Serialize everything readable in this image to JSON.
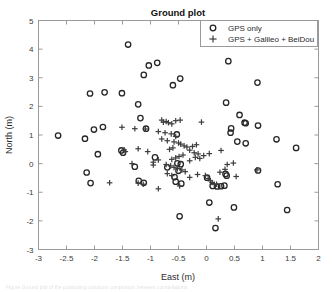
{
  "figure": {
    "title": "Ground plot",
    "caption_fragment": "Figure    Ground plot of the positioning solutions  comparison between constellations"
  },
  "legend": {
    "position": "top-right",
    "entries": [
      {
        "label": "GPS only",
        "marker": "circle-open-icon"
      },
      {
        "label": "GPS + Galileo + BeiDou",
        "marker": "plus-icon"
      }
    ]
  },
  "colors": {
    "gps_only": "#262626",
    "multi_gnss": "#3d3d3d",
    "axis": "#9a9a9a",
    "text": "#2b2b2b",
    "background": "#ffffff"
  },
  "chart_data": {
    "type": "scatter",
    "title": "Ground plot",
    "xlabel": "East (m)",
    "ylabel": "North (m)",
    "xlim": [
      -3,
      2
    ],
    "ylim": [
      -3,
      5
    ],
    "xticks": [
      -3,
      -2.5,
      -2,
      -1.5,
      -1,
      -0.5,
      0,
      0.5,
      1,
      1.5,
      2
    ],
    "xticklabels": [
      "-3",
      "-2.5",
      "-2",
      "-1.5",
      "-1",
      "-0.5",
      "0",
      "0.5",
      "1",
      "1.5",
      "2"
    ],
    "yticks": [
      -3,
      -2,
      -1,
      0,
      1,
      2,
      3,
      4,
      5
    ],
    "yticklabels": [
      "-3",
      "-2",
      "-1",
      "0",
      "1",
      "2",
      "3",
      "4",
      "5"
    ],
    "grid": false,
    "legend_position": "upper right",
    "series": [
      {
        "name": "GPS only",
        "marker": "o",
        "color": "#262626",
        "points": [
          [
            -1.4,
            4.16
          ],
          [
            -1.03,
            3.43
          ],
          [
            -0.88,
            3.52
          ],
          [
            0.39,
            3.58
          ],
          [
            -1.12,
            3.1
          ],
          [
            -0.6,
            2.74
          ],
          [
            -0.47,
            2.97
          ],
          [
            0.91,
            2.83
          ],
          [
            -2.08,
            2.45
          ],
          [
            -1.82,
            2.49
          ],
          [
            -1.51,
            2.46
          ],
          [
            -1.22,
            2.07
          ],
          [
            0.35,
            2.13
          ],
          [
            -1.18,
            1.59
          ],
          [
            0.59,
            1.7
          ],
          [
            0.68,
            1.43
          ],
          [
            0.7,
            1.41
          ],
          [
            0.92,
            1.33
          ],
          [
            -1.08,
            1.22
          ],
          [
            -0.53,
            1.02
          ],
          [
            0.44,
            1.23
          ],
          [
            0.43,
            1.08
          ],
          [
            -2.65,
            0.98
          ],
          [
            -2.17,
            0.87
          ],
          [
            -2.01,
            1.19
          ],
          [
            -1.85,
            1.28
          ],
          [
            0.55,
            0.77
          ],
          [
            0.7,
            0.71
          ],
          [
            1.25,
            0.85
          ],
          [
            1.6,
            0.55
          ],
          [
            -1.52,
            0.46
          ],
          [
            -1.49,
            0.38
          ],
          [
            -1.94,
            0.33
          ],
          [
            -0.92,
            0.22
          ],
          [
            -0.52,
            0.01
          ],
          [
            -0.46,
            -0.02
          ],
          [
            -2.14,
            -0.31
          ],
          [
            -2.07,
            -0.68
          ],
          [
            -1.28,
            -0.11
          ],
          [
            -0.7,
            -0.13
          ],
          [
            -0.5,
            -0.25
          ],
          [
            -0.57,
            -0.47
          ],
          [
            -0.55,
            -0.63
          ],
          [
            -0.45,
            -0.7
          ],
          [
            -1.21,
            -0.6
          ],
          [
            -1.12,
            -0.67
          ],
          [
            0.01,
            -0.49
          ],
          [
            0.11,
            -0.78
          ],
          [
            0.19,
            -0.8
          ],
          [
            0.26,
            -0.79
          ],
          [
            0.32,
            -0.77
          ],
          [
            0.36,
            -0.42
          ],
          [
            0.92,
            -0.24
          ],
          [
            1.27,
            -0.72
          ],
          [
            0.49,
            -1.53
          ],
          [
            1.44,
            -1.62
          ],
          [
            0.05,
            -1.36
          ],
          [
            -0.48,
            -1.84
          ],
          [
            0.16,
            -2.25
          ],
          [
            0.34,
            -0.36
          ]
        ]
      },
      {
        "name": "GPS + Galileo + BeiDou",
        "marker": "+",
        "color": "#3d3d3d",
        "points": [
          [
            -0.8,
            1.52
          ],
          [
            -0.77,
            1.45
          ],
          [
            -0.72,
            1.47
          ],
          [
            -0.68,
            1.43
          ],
          [
            -0.62,
            1.39
          ],
          [
            -0.55,
            1.5
          ],
          [
            -0.47,
            1.52
          ],
          [
            -0.09,
            1.45
          ],
          [
            -1.51,
            1.27
          ],
          [
            -1.28,
            1.22
          ],
          [
            -1.09,
            1.21
          ],
          [
            -0.86,
            1.12
          ],
          [
            -0.74,
            1.08
          ],
          [
            -0.63,
            1.04
          ],
          [
            -0.55,
            0.95
          ],
          [
            -0.8,
            0.86
          ],
          [
            -0.7,
            0.8
          ],
          [
            -0.58,
            0.76
          ],
          [
            -0.5,
            0.72
          ],
          [
            -0.46,
            0.68
          ],
          [
            -0.4,
            0.62
          ],
          [
            -0.35,
            0.58
          ],
          [
            -0.6,
            0.55
          ],
          [
            -0.66,
            0.5
          ],
          [
            -1.22,
            0.52
          ],
          [
            -1.47,
            0.48
          ],
          [
            -1.45,
            0.42
          ],
          [
            -0.3,
            0.47
          ],
          [
            -0.22,
            0.38
          ],
          [
            -0.15,
            0.34
          ],
          [
            -0.42,
            0.3
          ],
          [
            -0.49,
            0.25
          ],
          [
            -0.55,
            0.2
          ],
          [
            -0.62,
            0.15
          ],
          [
            -0.86,
            0.13
          ],
          [
            -0.95,
            0.05
          ],
          [
            -1.33,
            0.0
          ],
          [
            -0.72,
            -0.03
          ],
          [
            -0.64,
            -0.08
          ],
          [
            -0.58,
            -0.13
          ],
          [
            -0.52,
            -0.18
          ],
          [
            -0.44,
            -0.22
          ],
          [
            -0.38,
            -0.28
          ],
          [
            -0.3,
            0.1
          ],
          [
            -0.2,
            0.22
          ],
          [
            -0.12,
            0.18
          ],
          [
            -0.05,
            0.28
          ],
          [
            0.05,
            0.35
          ],
          [
            -1.73,
            -0.67
          ],
          [
            -1.22,
            -0.68
          ],
          [
            -1.13,
            -0.72
          ],
          [
            -0.86,
            -0.88
          ],
          [
            -0.7,
            -0.35
          ],
          [
            -0.62,
            -0.42
          ],
          [
            -0.3,
            -0.48
          ],
          [
            -0.16,
            -0.38
          ],
          [
            -0.02,
            -0.42
          ],
          [
            0.03,
            -0.52
          ],
          [
            0.07,
            -0.6
          ],
          [
            0.1,
            -0.66
          ],
          [
            0.14,
            -0.72
          ],
          [
            0.18,
            -0.72
          ],
          [
            0.24,
            -0.3
          ],
          [
            0.33,
            -0.2
          ],
          [
            0.48,
            0.02
          ],
          [
            0.53,
            -0.45
          ],
          [
            0.9,
            -0.22
          ],
          [
            0.21,
            -1.93
          ],
          [
            0.37,
            -0.03
          ],
          [
            0.26,
            0.46
          ],
          [
            -0.25,
            0.6
          ],
          [
            -0.18,
            0.66
          ],
          [
            -1.05,
            0.42
          ],
          [
            -0.95,
            -0.05
          ],
          [
            -0.48,
            -0.78
          ]
        ]
      }
    ]
  }
}
